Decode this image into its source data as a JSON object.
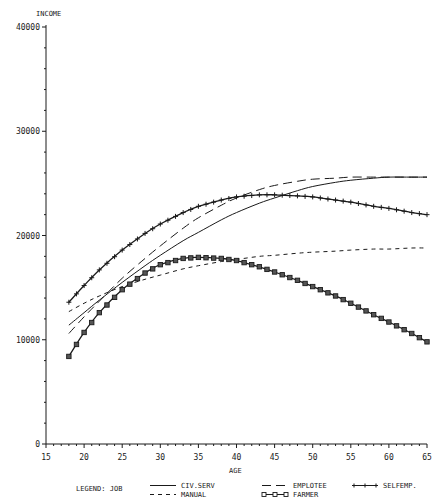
{
  "chart_data": {
    "type": "line",
    "title": "",
    "xlabel": "AGE",
    "ylabel": "INCOME",
    "xlim": [
      15,
      65
    ],
    "ylim": [
      0,
      40000
    ],
    "xticks": [
      15,
      20,
      25,
      30,
      35,
      40,
      45,
      50,
      55,
      60,
      65
    ],
    "yticks": [
      0,
      10000,
      20000,
      30000,
      40000
    ],
    "ytick_labels": [
      "0",
      "10000",
      "20000",
      "30000",
      "40000"
    ],
    "grid": false,
    "legend_position": "bottom",
    "legend_title": "LEGEND: JOB",
    "x": [
      18,
      20,
      22,
      25,
      28,
      30,
      33,
      35,
      38,
      40,
      43,
      45,
      48,
      50,
      53,
      55,
      58,
      60,
      63,
      65
    ],
    "series": [
      {
        "name": "CIV.SERV",
        "style": "solid",
        "values": [
          11400,
          12600,
          13800,
          15500,
          17100,
          18100,
          19500,
          20300,
          21500,
          22200,
          23100,
          23600,
          24300,
          24700,
          25100,
          25300,
          25500,
          25600,
          25600,
          25600
        ]
      },
      {
        "name": "EMPLOTEE",
        "style": "long-dash",
        "values": [
          10600,
          12200,
          13700,
          15900,
          17800,
          19000,
          20700,
          21700,
          22900,
          23600,
          24400,
          24800,
          25200,
          25400,
          25500,
          25600,
          25600,
          25600,
          25600,
          25600
        ]
      },
      {
        "name": "SELFEMP.",
        "style": "plus-marker",
        "values": [
          13600,
          15200,
          16700,
          18600,
          20200,
          21100,
          22200,
          22800,
          23400,
          23700,
          23900,
          23900,
          23800,
          23700,
          23400,
          23200,
          22800,
          22600,
          22200,
          22000
        ]
      },
      {
        "name": "MANUAL",
        "style": "short-dash",
        "values": [
          12700,
          13500,
          14200,
          15100,
          15800,
          16200,
          16800,
          17100,
          17500,
          17700,
          18000,
          18100,
          18300,
          18400,
          18500,
          18600,
          18700,
          18700,
          18800,
          18800
        ]
      },
      {
        "name": "FARMER",
        "style": "square-marker",
        "values": [
          8400,
          10700,
          12600,
          14800,
          16400,
          17200,
          17800,
          17900,
          17800,
          17600,
          17000,
          16500,
          15700,
          15100,
          14200,
          13500,
          12400,
          11700,
          10600,
          9800
        ]
      }
    ]
  },
  "axes": {
    "y_title": "INCOME",
    "x_title": "AGE"
  },
  "legend": {
    "title": "LEGEND: JOB",
    "items": [
      {
        "label": "CIV.SERV",
        "style": "solid"
      },
      {
        "label": "EMPLOTEE",
        "style": "long-dash"
      },
      {
        "label": "SELFEMP.",
        "style": "plus-marker"
      },
      {
        "label": "MANUAL",
        "style": "short-dash"
      },
      {
        "label": "FARMER",
        "style": "square-marker"
      }
    ]
  },
  "colors": {
    "ink": "#1a1a1a",
    "background": "#ffffff"
  }
}
